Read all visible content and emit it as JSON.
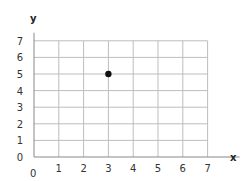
{
  "chart_data": {
    "type": "scatter",
    "title": "",
    "xlabel": "x",
    "ylabel": "y",
    "xlim": [
      0,
      7
    ],
    "ylim": [
      0,
      7
    ],
    "grid": true,
    "x_ticks": [
      "1",
      "2",
      "3",
      "4",
      "5",
      "6",
      "7"
    ],
    "y_ticks": [
      "0",
      "1",
      "2",
      "3",
      "4",
      "5",
      "6",
      "7"
    ],
    "origin_label": "0",
    "series": [
      {
        "name": "point",
        "points": [
          {
            "x": 3,
            "y": 5
          }
        ]
      }
    ],
    "colors": {
      "grid": "#bdbdbd",
      "axis": "#888888",
      "point": "#111111"
    }
  }
}
